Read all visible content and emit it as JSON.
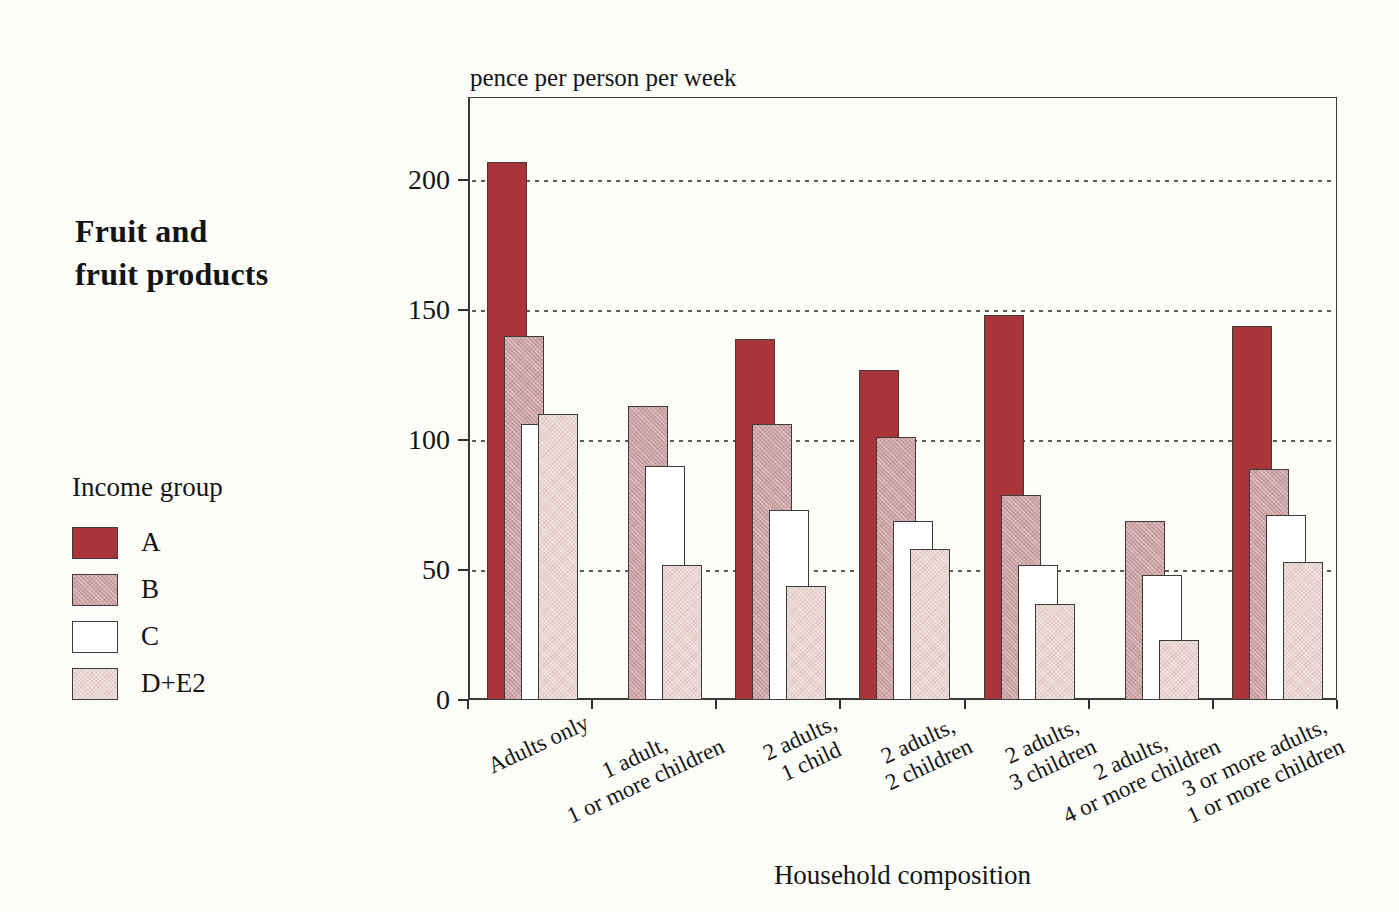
{
  "window": {
    "background": "#fcfcf9"
  },
  "chart_title": {
    "line1": "Fruit and",
    "line2": "fruit products"
  },
  "legend": {
    "title": "Income group",
    "items": [
      {
        "label": "A",
        "color": "#A93439",
        "texture": "none"
      },
      {
        "label": "B",
        "color": "#CDA2A4",
        "texture": "halftone"
      },
      {
        "label": "C",
        "color": "#FFFFFF",
        "texture": "none"
      },
      {
        "label": "D+E2",
        "color": "#EAD7D3",
        "texture": "halftone"
      }
    ]
  },
  "axes": {
    "y_unit_label": "pence per person per week",
    "x_title": "Household composition",
    "y_ticks": [
      0,
      50,
      100,
      150,
      200
    ],
    "y_max": 232
  },
  "chart_data": {
    "type": "bar",
    "title": "Fruit and fruit products",
    "ylabel": "pence per person per week",
    "xlabel": "Household composition",
    "ylim": [
      0,
      232
    ],
    "yticks": [
      0,
      50,
      100,
      150,
      200
    ],
    "grid": "horizontal-dashed",
    "legend_title": "Income group",
    "legend_position": "left",
    "categories": [
      "Adults only",
      "1 adult, 1 or more children",
      "2 adults, 1 child",
      "2 adults, 2 children",
      "2 adults, 3 children",
      "2 adults, 4 or more children",
      "3 or more adults, 1 or more children"
    ],
    "category_lines": [
      [
        "Adults only"
      ],
      [
        "1 adult,",
        "1 or more children"
      ],
      [
        "2 adults,",
        "1 child"
      ],
      [
        "2 adults,",
        "2 children"
      ],
      [
        "2 adults,",
        "3 children"
      ],
      [
        "2 adults,",
        "4 or more children"
      ],
      [
        "3 or more adults,",
        "1 or more children"
      ]
    ],
    "series": [
      {
        "name": "A",
        "color": "#A93439",
        "texture": "none",
        "values": [
          207,
          null,
          139,
          127,
          148,
          null,
          144
        ]
      },
      {
        "name": "B",
        "color": "#CDA2A4",
        "texture": "halftone",
        "values": [
          140,
          113,
          106,
          101,
          79,
          69,
          89
        ]
      },
      {
        "name": "C",
        "color": "#FFFFFF",
        "texture": "none",
        "values": [
          106,
          90,
          73,
          69,
          52,
          48,
          71
        ]
      },
      {
        "name": "D+E2",
        "color": "#EAD7D3",
        "texture": "halftone",
        "values": [
          110,
          52,
          44,
          58,
          37,
          23,
          53
        ]
      }
    ]
  }
}
